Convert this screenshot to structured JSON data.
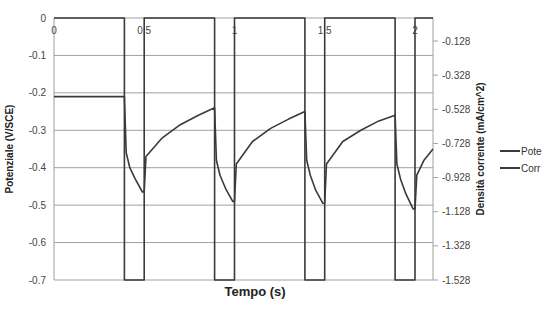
{
  "chart_data": {
    "type": "line",
    "title": "",
    "xlabel": "Tempo (s)",
    "ylabel": "Potenziale (V/SCE)",
    "y2label": "Densità corrente (mA/cm^2)",
    "xlim": [
      0,
      2.1
    ],
    "ylim": [
      -0.7,
      0
    ],
    "y2lim": [
      -1.528,
      0.072
    ],
    "x_ticks": [
      "0",
      "0.5",
      "1",
      "1.5",
      "2"
    ],
    "y_ticks": [
      "0",
      "-0.1",
      "-0.2",
      "-0.3",
      "-0.4",
      "-0.5",
      "-0.6",
      "-0.7"
    ],
    "y2_ticks": [
      "-0.128",
      "-0.328",
      "-0.528",
      "-0.728",
      "-0.928",
      "-1.128",
      "-1.328",
      "-1.528"
    ],
    "grid": true,
    "legend_position": "right",
    "series": [
      {
        "name": "Pote",
        "axis": "left",
        "color": "#3a3a3a",
        "x": [
          0,
          0.39,
          0.39,
          0.5,
          0.5,
          0.89,
          0.89,
          1.0,
          1.0,
          1.39,
          1.39,
          1.5,
          1.5,
          1.89,
          1.89,
          2.0,
          2.0,
          2.1
        ],
        "y": [
          0,
          0,
          -0.7,
          -0.7,
          0,
          0,
          -0.7,
          -0.7,
          0,
          0,
          -0.7,
          -0.7,
          0,
          0,
          -0.7,
          -0.7,
          0,
          0
        ]
      },
      {
        "name": "Corr",
        "axis": "left",
        "color": "#3a3a3a",
        "x": [
          0,
          0.39,
          0.4,
          0.42,
          0.45,
          0.49,
          0.5,
          0.51,
          0.6,
          0.7,
          0.8,
          0.89,
          0.9,
          0.92,
          0.95,
          0.99,
          1.0,
          1.01,
          1.1,
          1.2,
          1.3,
          1.39,
          1.4,
          1.42,
          1.45,
          1.49,
          1.5,
          1.51,
          1.6,
          1.7,
          1.8,
          1.89,
          1.9,
          1.92,
          1.95,
          1.99,
          2.0,
          2.01,
          2.05,
          2.1
        ],
        "y": [
          -0.21,
          -0.21,
          -0.36,
          -0.4,
          -0.43,
          -0.465,
          -0.465,
          -0.37,
          -0.32,
          -0.285,
          -0.26,
          -0.24,
          -0.38,
          -0.42,
          -0.455,
          -0.49,
          -0.49,
          -0.39,
          -0.33,
          -0.295,
          -0.27,
          -0.25,
          -0.38,
          -0.42,
          -0.46,
          -0.495,
          -0.495,
          -0.39,
          -0.33,
          -0.3,
          -0.275,
          -0.26,
          -0.39,
          -0.43,
          -0.47,
          -0.51,
          -0.51,
          -0.42,
          -0.38,
          -0.35
        ]
      }
    ]
  },
  "legend": [
    {
      "label": "Pote",
      "color": "#3a3a3a"
    },
    {
      "label": "Corr",
      "color": "#3a3a3a"
    }
  ]
}
